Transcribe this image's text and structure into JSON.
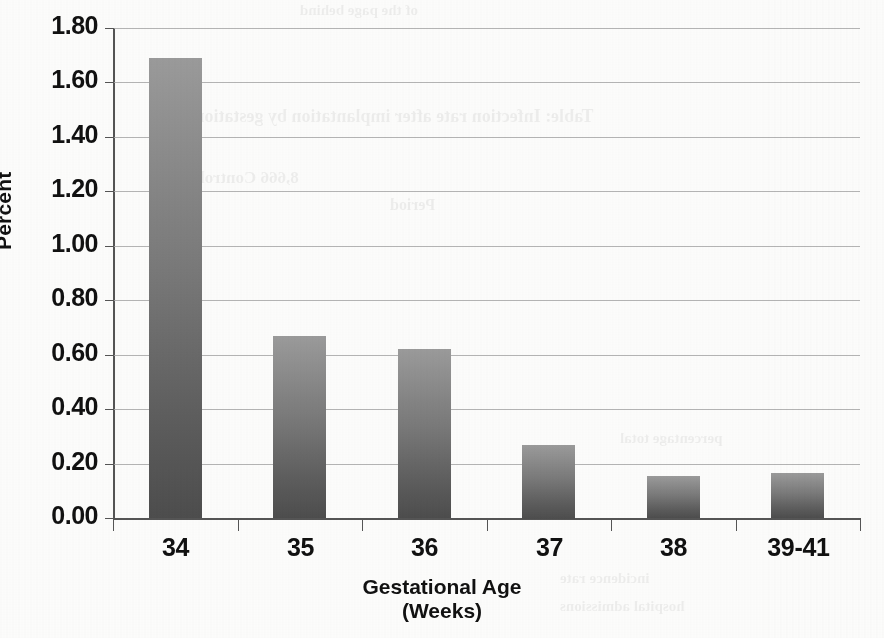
{
  "chart_data": {
    "type": "bar",
    "title": "",
    "categories": [
      "34",
      "35",
      "36",
      "37",
      "38",
      "39-41"
    ],
    "values": [
      1.69,
      0.67,
      0.62,
      0.27,
      0.155,
      0.165
    ],
    "series": [
      {
        "name": "Percent",
        "values": [
          1.69,
          0.67,
          0.62,
          0.27,
          0.155,
          0.165
        ]
      }
    ],
    "xlabel": "Gestational Age (Weeks)",
    "xlabel_line1": "Gestational Age",
    "xlabel_line2": "(Weeks)",
    "ylabel": "Percent",
    "ylim": [
      0.0,
      1.8
    ],
    "ytick_values": [
      1.8,
      1.6,
      1.4,
      1.2,
      1.0,
      0.8,
      0.6,
      0.4,
      0.2,
      0.0
    ],
    "ytick_labels": [
      "1.80",
      "1.60",
      "1.40",
      "1.20",
      "1.00",
      "0.80",
      "0.60",
      "0.40",
      "0.20",
      "0.00"
    ],
    "grid": true,
    "grid_axis": "y",
    "legend": false,
    "legend_position": "none",
    "bar_color_top": "#9b9b9b",
    "bar_color_bottom": "#4d4d4d",
    "axis_color": "#555555",
    "gridline_color": "#a8a8a8",
    "text_color": "#111111",
    "background": "#fdfdfc"
  },
  "page": {
    "ghost_text": [
      "of the page behind",
      "Table: Infection rate after implantation by gestational age",
      "8,666 Control",
      "Period",
      "incidence rate",
      "hospital admissions",
      "percentage total"
    ]
  }
}
